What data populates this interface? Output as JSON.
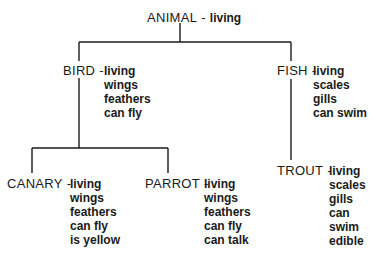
{
  "diagram": {
    "type": "semantic-network hierarchy",
    "line_color": "#1a1a1a",
    "separator": "-",
    "nodes": {
      "animal": {
        "name": "ANIMAL",
        "attributes": [
          "living"
        ]
      },
      "bird": {
        "name": "BIRD",
        "attributes": [
          "living",
          "wings",
          "feathers",
          "can fly"
        ]
      },
      "fish": {
        "name": "FISH",
        "attributes": [
          "living",
          "scales",
          "gills",
          "can swim"
        ]
      },
      "canary": {
        "name": "CANARY",
        "attributes": [
          "living",
          "wings",
          "feathers",
          "can fly",
          "is yellow"
        ]
      },
      "parrot": {
        "name": "PARROT",
        "attributes": [
          "living",
          "wings",
          "feathers",
          "can fly",
          "can talk"
        ]
      },
      "trout": {
        "name": "TROUT",
        "attributes": [
          "living",
          "scales",
          "gills",
          "can swim",
          "edible"
        ]
      }
    },
    "edges": [
      [
        "ANIMAL",
        "BIRD"
      ],
      [
        "ANIMAL",
        "FISH"
      ],
      [
        "BIRD",
        "CANARY"
      ],
      [
        "BIRD",
        "PARROT"
      ],
      [
        "FISH",
        "TROUT"
      ]
    ]
  }
}
